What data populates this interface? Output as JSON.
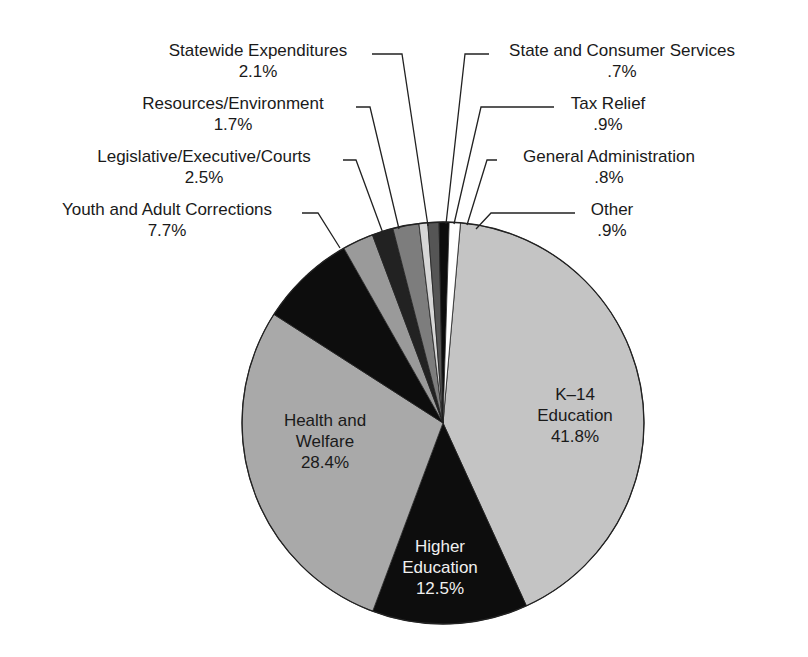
{
  "chart_data": {
    "type": "pie",
    "title": "",
    "start_angle_deg": 0,
    "direction": "clockwise",
    "slices": [
      {
        "label": "K–14 Education",
        "value": 41.8,
        "display": "41.8%",
        "color": "#c4c4c4"
      },
      {
        "label": "Higher Education",
        "value": 12.5,
        "display": "12.5%",
        "color": "#0d0d0d"
      },
      {
        "label": "Health and Welfare",
        "value": 28.4,
        "display": "28.4%",
        "color": "#a9a9a9"
      },
      {
        "label": "Youth and Adult Corrections",
        "value": 7.7,
        "display": "7.7%",
        "color": "#0d0d0d"
      },
      {
        "label": "Legislative/Executive/Courts",
        "value": 2.5,
        "display": "2.5%",
        "color": "#9a9a9a"
      },
      {
        "label": "Resources/Environment",
        "value": 1.7,
        "display": "1.7%",
        "color": "#222222"
      },
      {
        "label": "Statewide Expenditures",
        "value": 2.1,
        "display": "2.1%",
        "color": "#7d7d7d"
      },
      {
        "label": "State and Consumer Services",
        "value": 0.7,
        "display": ".7%",
        "color": "#d6d6d6"
      },
      {
        "label": "Tax Relief",
        "value": 0.9,
        "display": ".9%",
        "color": "#555555"
      },
      {
        "label": "General Administration",
        "value": 0.8,
        "display": ".8%",
        "color": "#0d0d0d"
      },
      {
        "label": "Other",
        "value": 0.9,
        "display": ".9%",
        "color": "#ffffff"
      }
    ]
  },
  "labels": {
    "k14": {
      "name1": "K–14",
      "name2": "Education",
      "pct": "41.8%"
    },
    "higher": {
      "name1": "Higher",
      "name2": "Education",
      "pct": "12.5%"
    },
    "health": {
      "name1": "Health and",
      "name2": "Welfare",
      "pct": "28.4%"
    },
    "youth": {
      "name": "Youth and Adult Corrections",
      "pct": "7.7%"
    },
    "legis": {
      "name": "Legislative/Executive/Courts",
      "pct": "2.5%"
    },
    "resources": {
      "name": "Resources/Environment",
      "pct": "1.7%"
    },
    "statewide": {
      "name": "Statewide Expenditures",
      "pct": "2.1%"
    },
    "stateconsumer": {
      "name": "State and Consumer Services",
      "pct": ".7%"
    },
    "tax": {
      "name": "Tax Relief",
      "pct": ".9%"
    },
    "genadmin": {
      "name": "General Administration",
      "pct": ".8%"
    },
    "other": {
      "name": "Other",
      "pct": ".9%"
    }
  }
}
